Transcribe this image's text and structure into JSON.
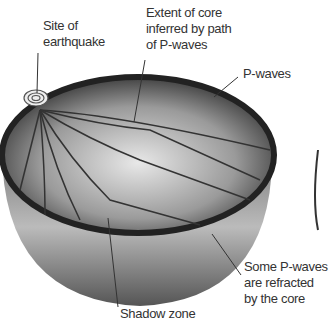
{
  "labels": {
    "site": [
      "Site of",
      "earthquake"
    ],
    "core": [
      "Extent of core",
      "inferred by path",
      "of P-waves"
    ],
    "pwaves": "P-waves",
    "refracted": [
      "Some P-waves",
      "are refracted",
      "by the core"
    ],
    "shadow": "Shadow zone"
  }
}
